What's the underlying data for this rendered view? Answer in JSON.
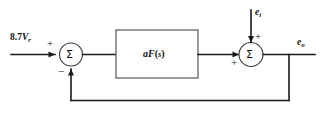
{
  "diagram": {
    "type": "control-system-block-diagram",
    "background_color": "#ffffff",
    "line_color": "#1a1a1a",
    "block_stroke_color": "#555555",
    "node_stroke_color": "#3a3a3a",
    "input": {
      "label_number": "8.7",
      "label_var": "V",
      "label_sub": "r",
      "full_label": "8.7Vr",
      "sign_at_junction": "+"
    },
    "summing_junction_1": {
      "symbol": "Σ",
      "name": "error-summing-junction",
      "input_sign": "+",
      "feedback_sign": "−"
    },
    "gain_block": {
      "label_gain": "a",
      "label_func": "F",
      "label_open_paren": "(",
      "label_arg": "s",
      "label_close_paren": ")",
      "full_label": "aF(s)"
    },
    "summing_junction_2": {
      "symbol": "Σ",
      "name": "output-summing-junction",
      "forward_sign": "+",
      "disturbance_sign": "+"
    },
    "disturbance": {
      "label_var": "e",
      "label_sub": "i",
      "full_label": "ei"
    },
    "output": {
      "label_var": "e",
      "label_sub": "o",
      "full_label": "eo"
    },
    "feedback": {
      "name": "unity-feedback-path",
      "description": "output tapped and returned to first summing junction"
    }
  }
}
